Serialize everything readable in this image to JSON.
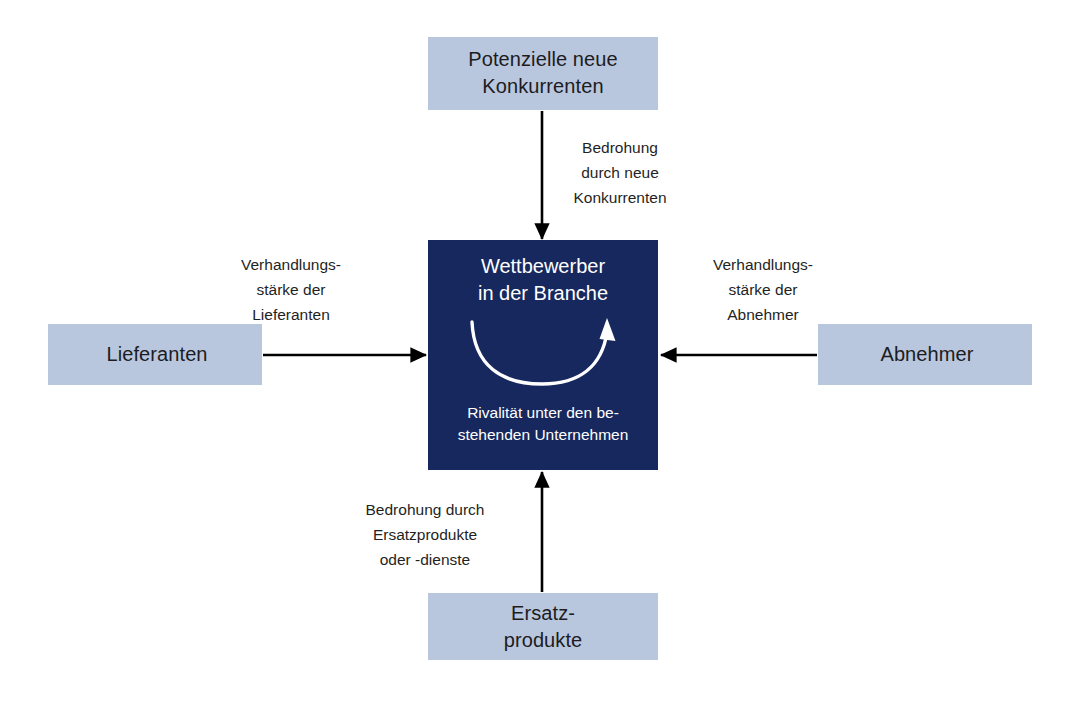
{
  "diagram": {
    "center": {
      "title_line1": "Wettbewerber",
      "title_line2": "in der Branche",
      "subtitle_line1": "Rivalität unter den be-",
      "subtitle_line2": "stehenden Unternehmen",
      "background_color": "#16285e",
      "text_color": "#ffffff",
      "inner_arrow_icon": "curved-rivalry-arrow-icon"
    },
    "forces": [
      {
        "id": "new-entrants",
        "position": "top",
        "box_label_line1": "Potenzielle neue",
        "box_label_line2": "Konkurrenten",
        "edge_label": "Bedrohung\ndurch neue\nKonkurrenten",
        "arrow_direction": "down"
      },
      {
        "id": "suppliers",
        "position": "left",
        "box_label_line1": "Lieferanten",
        "box_label_line2": "",
        "edge_label": "Verhandlungs-\nstärke der\nLieferanten",
        "arrow_direction": "right"
      },
      {
        "id": "buyers",
        "position": "right",
        "box_label_line1": "Abnehmer",
        "box_label_line2": "",
        "edge_label": "Verhandlungs-\nstärke der\nAbnehmer",
        "arrow_direction": "left"
      },
      {
        "id": "substitutes",
        "position": "bottom",
        "box_label_line1": "Ersatz-",
        "box_label_line2": "produkte",
        "edge_label": "Bedrohung durch\nErsatzprodukte\noder -dienste",
        "arrow_direction": "up"
      }
    ],
    "colors": {
      "box_fill": "#b9c7de",
      "center_fill": "#16285e",
      "arrow": "#000000",
      "text": "#1c1c22",
      "background": "#ffffff"
    }
  }
}
